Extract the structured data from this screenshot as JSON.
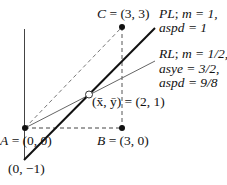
{
  "points": {
    "A": {
      "label": "A = (0, 0)",
      "name": "A",
      "coords": "= (0, 0)"
    },
    "B": {
      "label": "B = (3, 0)",
      "name": "B",
      "coords": "= (3, 0)"
    },
    "C": {
      "label": "C = (3, 3)",
      "name": "C",
      "coords": "= (3, 3)"
    },
    "intercept": {
      "label": "(0, −1)"
    },
    "mean": {
      "label": "(x̄, ȳ) = (2, 1)"
    }
  },
  "lines": {
    "PL": {
      "line1": "PL; m = 1,",
      "line2": "aspd = 1",
      "name": "PL",
      "m": "m = 1,",
      "aspd": "aspd = 1"
    },
    "RL": {
      "line1": "RL; m = 1/2,",
      "line2": "asye = 3/2,",
      "line3": "aspd = 9/8",
      "name": "RL",
      "m": "m = 1/2,",
      "asye": "asye = 3/2,",
      "aspd": "aspd = 9/8"
    }
  }
}
